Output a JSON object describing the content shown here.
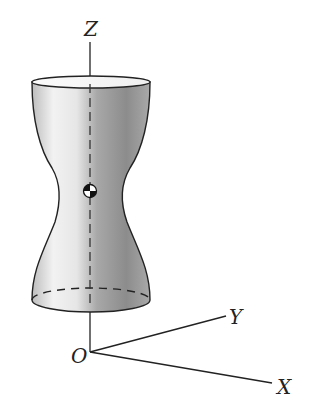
{
  "figure": {
    "axes": {
      "z_label": "Z",
      "y_label": "Y",
      "x_label": "X",
      "origin_label": "O"
    },
    "body": {
      "shape": "hourglass-solid-of-revolution",
      "center_of_mass_symbol": "center-of-mass-icon"
    },
    "colors": {
      "stroke": "#222222",
      "shade_light": "#f4f4f4",
      "shade_dark": "#8a8a8a",
      "background": "#ffffff"
    }
  }
}
